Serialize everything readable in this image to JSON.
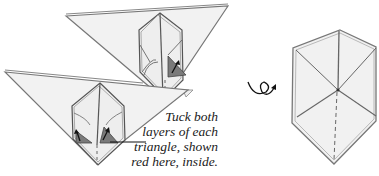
{
  "diagram": {
    "type": "origami-instruction-step",
    "caption": {
      "lines": [
        "Tuck both",
        "layers of each",
        "triangle, shown",
        "red here, inside."
      ]
    },
    "symbols": {
      "turn_over": "turn-over-icon"
    },
    "colors": {
      "paper": "#f0f0f0",
      "paper_edge": "#8a8a8a",
      "line": "#4a4a4a",
      "tuck_triangle": "#7a7a7a",
      "arrow": "#111111",
      "text": "#1a1a1a"
    }
  }
}
